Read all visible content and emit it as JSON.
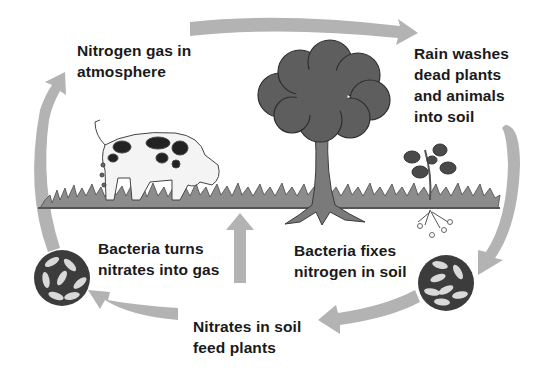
{
  "labels": {
    "atmosphere": "Nitrogen gas in\natmosphere",
    "rain": "Rain washes\ndead plants\nand animals\ninto soil",
    "bacteria_gas": "Bacteria turns\nnitrates into gas",
    "bacteria_fix": "Bacteria fixes\nnitrogen in soil",
    "nitrates": "Nitrates in soil\nfeed plants"
  },
  "elements": {
    "cow": "cow-grazing",
    "tree": "tree",
    "plant": "small-plant-with-roots",
    "bacteria_left": "bacteria-circle",
    "bacteria_right": "bacteria-circle"
  },
  "colors": {
    "arrow": "#b3b3b3",
    "grass": "#8c8c8c",
    "ground_line": "#555555",
    "tree_crown": "#5e5e5e",
    "bacteria_bg": "#3c3c3c",
    "bacteria_cell": "#d9d9d9",
    "text": "#1a1a1a"
  }
}
